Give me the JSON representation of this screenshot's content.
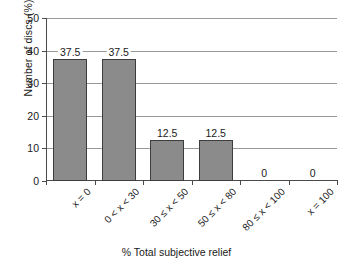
{
  "chart_data": {
    "type": "bar",
    "title": "",
    "xlabel": "% Total subjective relief",
    "ylabel": "Number of discs (%)",
    "categories": [
      "x = 0",
      "0 < x < 30",
      "30 ≤ x < 50",
      "50 ≤ x < 80",
      "80 ≤ x < 100",
      "x = 100"
    ],
    "values": [
      37.5,
      37.5,
      12.5,
      12.5,
      0,
      0
    ],
    "value_labels": [
      "37.5",
      "37.5",
      "12.5",
      "12.5",
      "0",
      "0"
    ],
    "ylim": [
      0,
      50
    ],
    "yticks": [
      0,
      10,
      20,
      30,
      40,
      50
    ],
    "ytick_labels": [
      "0",
      "10",
      "20",
      "30",
      "40",
      "50"
    ],
    "grid": "horizontal",
    "legend": "none",
    "bar_color": "#8b8b8b",
    "bar_border_color": "#3d3d3d",
    "axis_color": "#4a4a4a",
    "gridline_color": "#9a9a9a"
  }
}
